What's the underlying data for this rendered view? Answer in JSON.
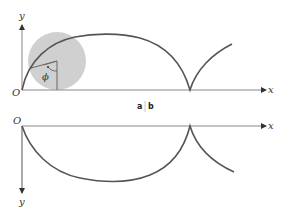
{
  "diagram": {
    "panels": {
      "a_label": "a",
      "b_label": "b"
    },
    "top": {
      "x_axis_label": "x",
      "y_axis_label": "y",
      "origin_label": "O",
      "angle_label": "ϕ",
      "circle_color": "#cfcfcf",
      "curve_color": "#555555"
    },
    "bottom": {
      "x_axis_label": "x",
      "y_axis_label": "y",
      "origin_label": "O",
      "curve_color": "#555555"
    },
    "colors": {
      "axis": "#888888",
      "curve": "#555555",
      "circle_fill": "#d0d0d0"
    }
  }
}
